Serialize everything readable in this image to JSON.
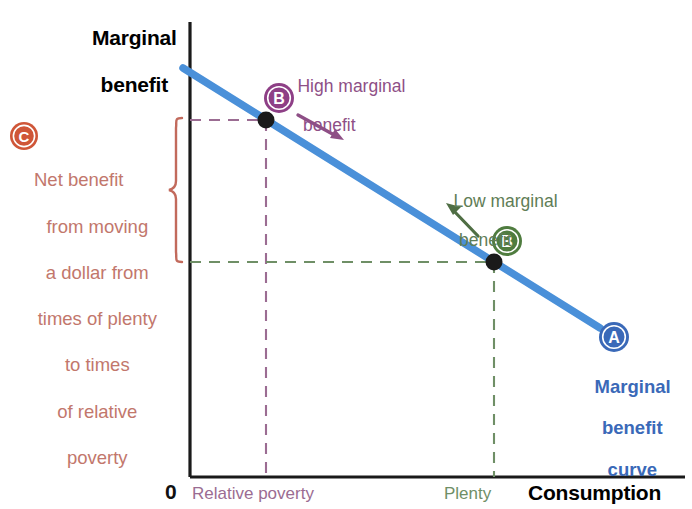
{
  "figure": {
    "kind": "economics-line-diagram",
    "background": "#ffffff",
    "width": 692,
    "height": 509
  },
  "axes": {
    "y_title_line1": "Marginal",
    "y_title_line2": "benefit",
    "x_title": "Consumption",
    "origin_label": "0",
    "x_ticks": [
      {
        "label": "Relative poverty",
        "color": "#9b6c92",
        "x_px": 266
      },
      {
        "label": "Plenty",
        "color": "#6f8f66",
        "x_px": 494
      }
    ],
    "axis_color": "#1a1a1a",
    "x_axis_y_px": 477,
    "y_axis_x_px": 190,
    "x_axis_right_px": 685,
    "y_axis_top_px": 22
  },
  "annotations": {
    "high": {
      "badge": "B",
      "badge_color": "#8e3f86",
      "text_line1": "High marginal",
      "text_line2": "benefit",
      "text_color": "#8e4f86",
      "arrow_color": "#8e4f86"
    },
    "low": {
      "badge": "B",
      "badge_color": "#4f7c3f",
      "text_line1": "Low marginal",
      "text_line2": "benefit",
      "text_color": "#5f7d56",
      "arrow_color": "#4f6e44"
    },
    "curve": {
      "badge": "A",
      "badge_color": "#3a69b8",
      "text_line1": "Marginal",
      "text_line2": "benefit",
      "text_line3": "curve",
      "text_color": "#3a69b8"
    },
    "net_benefit": {
      "badge": "C",
      "badge_color": "#cf5638",
      "text_line1": "Net benefit",
      "text_line2": "from moving",
      "text_line3": "a dollar from",
      "text_line4": "times of plenty",
      "text_line5": "to times",
      "text_line6": "of relative",
      "text_line7": "poverty",
      "text_color": "#c2776c",
      "brace_color": "#c26a5c"
    }
  },
  "chart_data": {
    "type": "line",
    "title": "Marginal benefit curve",
    "xlabel": "Consumption",
    "ylabel": "Marginal benefit",
    "grid": false,
    "legend": "none",
    "xlim": [
      0,
      1
    ],
    "ylim": [
      0,
      1
    ],
    "series": [
      {
        "name": "Marginal benefit curve",
        "color": "#4a90d9",
        "type": "line",
        "points": [
          {
            "x_px": 183,
            "y_px": 68
          },
          {
            "x_px": 600,
            "y_px": 328
          }
        ]
      }
    ],
    "markers": [
      {
        "name": "B-high",
        "label": "B",
        "x_px": 266,
        "y_px": 120,
        "x_tick": "Relative poverty",
        "note": "High marginal benefit",
        "color": "#1a1a1a"
      },
      {
        "name": "B-low",
        "label": "B",
        "x_px": 494,
        "y_px": 262,
        "x_tick": "Plenty",
        "note": "Low marginal benefit",
        "color": "#1a1a1a"
      }
    ],
    "guides": [
      {
        "name": "high-horizontal",
        "orientation": "horizontal",
        "color": "#9b6c92",
        "from_px": [
          190,
          120
        ],
        "to_px": [
          266,
          120
        ]
      },
      {
        "name": "high-vertical",
        "orientation": "vertical",
        "color": "#9b6c92",
        "from_px": [
          266,
          120
        ],
        "to_px": [
          266,
          477
        ]
      },
      {
        "name": "low-horizontal",
        "orientation": "horizontal",
        "color": "#6f8f66",
        "from_px": [
          190,
          262
        ],
        "to_px": [
          494,
          262
        ]
      },
      {
        "name": "low-vertical",
        "orientation": "vertical",
        "color": "#6f8f66",
        "from_px": [
          494,
          262
        ],
        "to_px": [
          494,
          477
        ]
      }
    ],
    "brace": {
      "name": "net-benefit-brace",
      "from_y_px": 118,
      "to_y_px": 262,
      "x_px": 178,
      "color": "#c26a5c",
      "measures": "Net benefit from moving a dollar from times of plenty to times of relative poverty"
    }
  }
}
